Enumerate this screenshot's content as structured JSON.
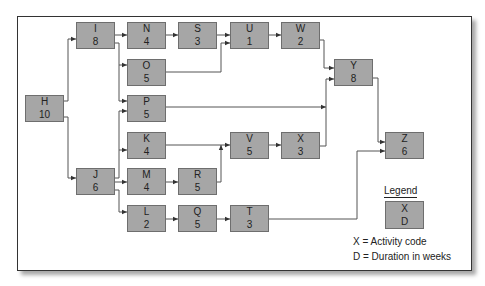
{
  "diagram": {
    "type": "activity-on-node network",
    "nodes": [
      {
        "code": "H",
        "duration": "10",
        "x": 25,
        "y": 95
      },
      {
        "code": "I",
        "duration": "8",
        "x": 76,
        "y": 22
      },
      {
        "code": "J",
        "duration": "6",
        "x": 76,
        "y": 168
      },
      {
        "code": "N",
        "duration": "4",
        "x": 127,
        "y": 22
      },
      {
        "code": "O",
        "duration": "5",
        "x": 127,
        "y": 59
      },
      {
        "code": "P",
        "duration": "5",
        "x": 127,
        "y": 95
      },
      {
        "code": "K",
        "duration": "4",
        "x": 127,
        "y": 132
      },
      {
        "code": "M",
        "duration": "4",
        "x": 127,
        "y": 168
      },
      {
        "code": "L",
        "duration": "2",
        "x": 127,
        "y": 205
      },
      {
        "code": "S",
        "duration": "3",
        "x": 178,
        "y": 22
      },
      {
        "code": "R",
        "duration": "5",
        "x": 178,
        "y": 168
      },
      {
        "code": "Q",
        "duration": "5",
        "x": 178,
        "y": 205
      },
      {
        "code": "U",
        "duration": "1",
        "x": 230,
        "y": 22
      },
      {
        "code": "V",
        "duration": "5",
        "x": 230,
        "y": 132
      },
      {
        "code": "T",
        "duration": "3",
        "x": 230,
        "y": 205
      },
      {
        "code": "W",
        "duration": "2",
        "x": 281,
        "y": 22
      },
      {
        "code": "X",
        "duration": "3",
        "x": 281,
        "y": 132
      },
      {
        "code": "Y",
        "duration": "8",
        "x": 334,
        "y": 59
      },
      {
        "code": "Z",
        "duration": "6",
        "x": 385,
        "y": 132
      }
    ],
    "edges": [
      [
        "H",
        "I"
      ],
      [
        "H",
        "J"
      ],
      [
        "I",
        "N"
      ],
      [
        "I",
        "O"
      ],
      [
        "I",
        "P"
      ],
      [
        "J",
        "P"
      ],
      [
        "J",
        "K"
      ],
      [
        "J",
        "M"
      ],
      [
        "J",
        "L"
      ],
      [
        "N",
        "S"
      ],
      [
        "S",
        "U"
      ],
      [
        "O",
        "U"
      ],
      [
        "U",
        "W"
      ],
      [
        "W",
        "Y"
      ],
      [
        "P",
        "Y"
      ],
      [
        "X",
        "Y"
      ],
      [
        "K",
        "V"
      ],
      [
        "M",
        "R"
      ],
      [
        "R",
        "V"
      ],
      [
        "V",
        "X"
      ],
      [
        "L",
        "Q"
      ],
      [
        "Q",
        "T"
      ],
      [
        "Y",
        "Z"
      ],
      [
        "T",
        "Z"
      ]
    ]
  },
  "legend": {
    "title": "Legend",
    "box_top": "X",
    "box_bottom": "D",
    "line1": "X = Activity code",
    "line2": "D = Duration in weeks"
  },
  "colors": {
    "node_fill": "#a6a6a6",
    "node_border": "#6e6e6e",
    "line": "#555555"
  }
}
